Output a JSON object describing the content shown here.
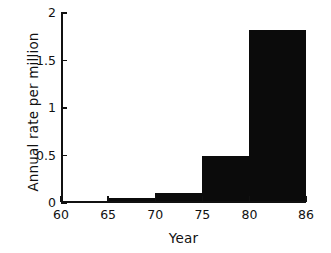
{
  "chart_data": {
    "type": "bar",
    "title": "",
    "subtitle": "",
    "xlabel": "Year",
    "ylabel": "Annual rate per million",
    "xlim": [
      60,
      86
    ],
    "ylim": [
      0,
      2
    ],
    "grid": false,
    "legend": null,
    "xtick_labels": [
      "60",
      "65",
      "70",
      "75",
      "80",
      "86"
    ],
    "xtick_values": [
      60,
      65,
      70,
      75,
      80,
      86
    ],
    "ytick_labels": [
      "0",
      "0.5",
      "1",
      "1.5",
      "2"
    ],
    "ytick_values": [
      0,
      0.5,
      1,
      1.5,
      2
    ],
    "bin_edges": [
      60,
      65,
      70,
      75,
      80,
      86
    ],
    "categories": [
      "60-65",
      "65-70",
      "70-75",
      "75-80",
      "80-86"
    ],
    "values": [
      0.0,
      0.05,
      0.11,
      0.49,
      1.82
    ],
    "bar_color": "#0b0b0b",
    "annotations": []
  },
  "axes": {
    "y_title": "Annual rate per million",
    "x_title": "Year"
  }
}
